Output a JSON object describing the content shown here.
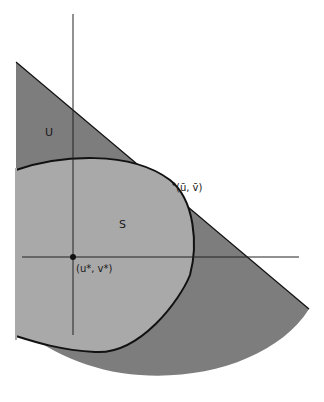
{
  "diagram": {
    "regions": {
      "U": {
        "label": "U",
        "fill": "#7d7d7d"
      },
      "S": {
        "label": "S",
        "fill": "#a9a9a9"
      }
    },
    "points": {
      "tangent": {
        "label": "(ū, v̄)"
      },
      "origin": {
        "label": "(u*, v*)"
      }
    },
    "colors": {
      "background": "#ffffff",
      "stroke": "#111111",
      "axis": "#222222"
    }
  }
}
